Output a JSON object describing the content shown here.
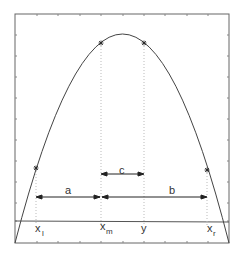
{
  "diagram": {
    "type": "parabola-interval-search",
    "curve": {
      "shape": "concave-down parabola",
      "color": "#444444"
    },
    "points": [
      {
        "name": "x_l",
        "label": "x",
        "sub": "l"
      },
      {
        "name": "x_m",
        "label": "x",
        "sub": "m"
      },
      {
        "name": "y",
        "label": "y",
        "sub": ""
      },
      {
        "name": "x_r",
        "label": "x",
        "sub": "r"
      }
    ],
    "intervals": [
      {
        "name": "a",
        "label": "a",
        "from": "x_l",
        "to": "x_m"
      },
      {
        "name": "b",
        "label": "b",
        "from": "x_m",
        "to": "x_r"
      },
      {
        "name": "c",
        "label": "c",
        "from": "x_m",
        "to": "y"
      }
    ],
    "colors": {
      "line": "#444444",
      "dotted": "#bbbbbb",
      "frame": "#666666"
    }
  }
}
